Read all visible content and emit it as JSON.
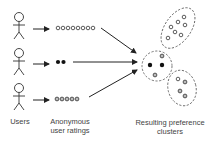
{
  "labels": {
    "users": "Users",
    "ratings_line1": "Anonymous",
    "ratings_line2": "user ratings",
    "clusters_line1": "Resulting preference",
    "clusters_line2": "clusters"
  },
  "users": [
    {
      "id": "user-1",
      "rating_style": "hollow",
      "rating_count": 8
    },
    {
      "id": "user-2",
      "rating_style": "filled",
      "rating_count": 2
    },
    {
      "id": "user-3",
      "rating_style": "hatched",
      "rating_count": 5
    }
  ],
  "clusters": [
    {
      "id": "cluster-top",
      "members": 7,
      "style": "hollow"
    },
    {
      "id": "cluster-middle",
      "members": 4,
      "style": "mixed"
    },
    {
      "id": "cluster-bottom",
      "members": 4,
      "style": "mixed"
    }
  ],
  "colors": {
    "stroke": "#222222",
    "dashed": "#555555",
    "text": "#444444"
  }
}
